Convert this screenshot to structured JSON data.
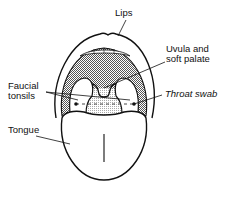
{
  "diagram": {
    "labels": {
      "lips": "Lips",
      "uvula_line1": "Uvula and",
      "uvula_line2": "soft palate",
      "faucial_line1": "Faucial",
      "faucial_line2": "tonsils",
      "throat_swab": "Throat swab",
      "tongue": "Tongue"
    },
    "colors": {
      "ink": "#111111",
      "background": "#ffffff",
      "palate_shade": "#9a9a9a",
      "pharynx_shade": "#d6d6d6"
    }
  }
}
